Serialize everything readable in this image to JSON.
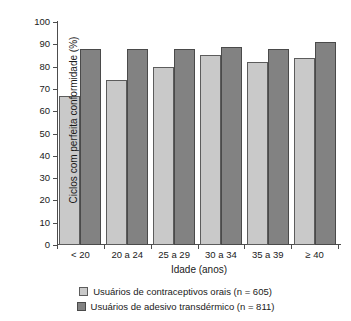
{
  "chart_data": {
    "type": "bar",
    "title": "",
    "subtitle": "",
    "xlabel": "Idade (anos)",
    "ylabel": "Ciclos com perfeita conformidade (%)",
    "categories": [
      "< 20",
      "20 a 24",
      "25 a 29",
      "30 a 34",
      "35 a 39",
      "≥ 40"
    ],
    "series": [
      {
        "name": "Usuários de contraceptivos orais (n = 605)",
        "color": "#c9c9c9",
        "values": [
          67,
          74,
          80,
          85,
          82,
          84
        ]
      },
      {
        "name": "Usuários de adesivo transdérmico (n = 811)",
        "color": "#828282",
        "values": [
          88,
          88,
          88,
          89,
          88,
          91
        ]
      }
    ],
    "ylim": [
      0,
      100
    ],
    "ytick_labels": [
      "0",
      "10",
      "20",
      "30",
      "40",
      "50",
      "60",
      "70",
      "80",
      "90",
      "100"
    ],
    "ytick_values": [
      0,
      10,
      20,
      30,
      40,
      50,
      60,
      70,
      80,
      90,
      100
    ],
    "grid": false,
    "legend_position": "bottom"
  }
}
